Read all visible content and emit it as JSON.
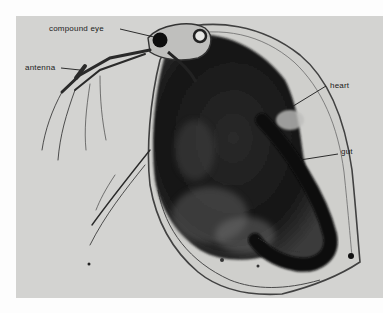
{
  "figure": {
    "background_color": "#d3d3d1",
    "labels": [
      {
        "id": "compound-eye",
        "text": "compound eye"
      },
      {
        "id": "antenna",
        "text": "antenna"
      },
      {
        "id": "heart",
        "text": "heart"
      },
      {
        "id": "gut",
        "text": "gut"
      }
    ]
  }
}
